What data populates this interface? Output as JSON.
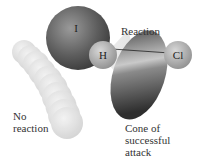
{
  "diagram": {
    "atoms": [
      {
        "symbol": "I"
      },
      {
        "symbol": "H"
      },
      {
        "symbol": "Cl"
      }
    ],
    "labels": {
      "reaction": "Reaction",
      "no_reaction": "No\nreaction",
      "cone": "Cone of\nsuccessful\nattack"
    }
  }
}
